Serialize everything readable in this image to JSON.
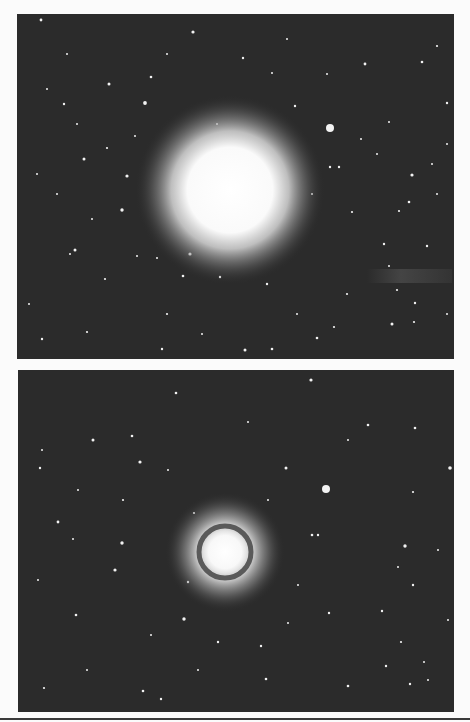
{
  "figure": {
    "background_color": "#fbfbfb",
    "sky_color": "#2b2b2b",
    "panels": [
      {
        "id": "top",
        "galaxy": {
          "cx": 213,
          "cy": 176,
          "core_r": 46,
          "halo_r": 95,
          "ring": false
        },
        "companion": {
          "cx": 313,
          "cy": 114,
          "r": 4
        },
        "streak": {
          "x": 350,
          "y": 255,
          "w": 85,
          "h": 14
        }
      },
      {
        "id": "bottom",
        "galaxy": {
          "cx": 207,
          "cy": 182,
          "core_r": 22,
          "ring_r": 26,
          "halo_r": 60,
          "ring": true
        },
        "companion": {
          "cx": 308,
          "cy": 119,
          "r": 4
        }
      }
    ],
    "stars_top": [
      [
        24,
        6,
        1.4
      ],
      [
        176,
        18,
        1.6
      ],
      [
        226,
        44,
        1.2
      ],
      [
        255,
        59,
        1
      ],
      [
        134,
        63,
        1.3
      ],
      [
        92,
        70,
        1.5
      ],
      [
        30,
        75,
        1
      ],
      [
        47,
        90,
        1.2
      ],
      [
        128,
        89,
        1.9
      ],
      [
        310,
        60,
        1
      ],
      [
        348,
        50,
        1.4
      ],
      [
        405,
        48,
        1.3
      ],
      [
        420,
        32,
        1.1
      ],
      [
        430,
        89,
        1.2
      ],
      [
        372,
        108,
        1
      ],
      [
        278,
        92,
        1.2
      ],
      [
        118,
        122,
        1
      ],
      [
        67,
        145,
        1.5
      ],
      [
        90,
        134,
        1.1
      ],
      [
        110,
        162,
        1.6
      ],
      [
        313,
        153,
        1.2
      ],
      [
        322,
        153,
        1.2
      ],
      [
        395,
        161,
        1.6
      ],
      [
        392,
        188,
        1.3
      ],
      [
        382,
        197,
        1.1
      ],
      [
        105,
        196,
        1.7
      ],
      [
        58,
        236,
        1.5
      ],
      [
        173,
        240,
        1.6
      ],
      [
        120,
        242,
        1
      ],
      [
        140,
        244,
        1
      ],
      [
        166,
        262,
        1.3
      ],
      [
        203,
        263,
        1.2
      ],
      [
        250,
        270,
        1.2
      ],
      [
        367,
        230,
        1.2
      ],
      [
        372,
        252,
        1
      ],
      [
        380,
        276,
        1.1
      ],
      [
        398,
        289,
        1.2
      ],
      [
        397,
        308,
        1.1
      ],
      [
        375,
        310,
        1.5
      ],
      [
        228,
        336,
        1.5
      ],
      [
        255,
        335,
        1.3
      ],
      [
        145,
        335,
        1.2
      ],
      [
        53,
        240,
        1
      ],
      [
        25,
        325,
        1.2
      ],
      [
        70,
        318,
        1.1
      ],
      [
        300,
        324,
        1.3
      ],
      [
        317,
        313,
        1.1
      ],
      [
        410,
        232,
        1.2
      ],
      [
        344,
        125,
        1
      ],
      [
        252,
        170,
        1
      ],
      [
        20,
        160,
        1
      ],
      [
        40,
        180,
        1
      ],
      [
        150,
        300,
        1.1
      ],
      [
        185,
        320,
        1
      ],
      [
        280,
        300,
        1
      ],
      [
        330,
        280,
        1.1
      ],
      [
        420,
        180,
        1
      ],
      [
        430,
        130,
        1
      ],
      [
        415,
        150,
        1
      ],
      [
        60,
        110,
        1
      ],
      [
        75,
        205,
        1
      ],
      [
        88,
        265,
        1.1
      ],
      [
        12,
        290,
        1
      ],
      [
        200,
        110,
        1
      ],
      [
        295,
        180,
        1
      ],
      [
        335,
        198,
        1.1
      ],
      [
        360,
        140,
        1
      ],
      [
        270,
        25,
        1
      ],
      [
        150,
        40,
        1
      ],
      [
        50,
        40,
        1
      ],
      [
        430,
        300,
        1
      ]
    ],
    "stars_bottom": [
      [
        158,
        23,
        1.3
      ],
      [
        293,
        10,
        1.6
      ],
      [
        350,
        55,
        1.3
      ],
      [
        397,
        58,
        1.3
      ],
      [
        230,
        52,
        1
      ],
      [
        114,
        66,
        1.3
      ],
      [
        75,
        70,
        1.5
      ],
      [
        24,
        80,
        1
      ],
      [
        22,
        98,
        1.2
      ],
      [
        122,
        92,
        1.6
      ],
      [
        268,
        98,
        1.5
      ],
      [
        432,
        98,
        1.8
      ],
      [
        395,
        122,
        1.1
      ],
      [
        105,
        130,
        1.1
      ],
      [
        40,
        152,
        1.4
      ],
      [
        55,
        169,
        1
      ],
      [
        104,
        173,
        1.7
      ],
      [
        176,
        143,
        1.1
      ],
      [
        294,
        165,
        1.3
      ],
      [
        300,
        165,
        1.2
      ],
      [
        387,
        176,
        1.7
      ],
      [
        380,
        197,
        1
      ],
      [
        395,
        215,
        1.2
      ],
      [
        97,
        200,
        1.6
      ],
      [
        170,
        212,
        1.2
      ],
      [
        58,
        245,
        1.3
      ],
      [
        166,
        249,
        1.7
      ],
      [
        133,
        265,
        1
      ],
      [
        311,
        243,
        1.2
      ],
      [
        364,
        241,
        1.2
      ],
      [
        200,
        272,
        1.2
      ],
      [
        243,
        276,
        1.2
      ],
      [
        270,
        253,
        1
      ],
      [
        383,
        272,
        1.1
      ],
      [
        368,
        296,
        1.2
      ],
      [
        406,
        292,
        1
      ],
      [
        392,
        314,
        1.2
      ],
      [
        330,
        316,
        1.3
      ],
      [
        248,
        309,
        1.3
      ],
      [
        125,
        321,
        1.3
      ],
      [
        143,
        329,
        1.2
      ],
      [
        26,
        318,
        1.1
      ],
      [
        69,
        300,
        1
      ],
      [
        300,
        345,
        1.1
      ],
      [
        336,
        345,
        1.3
      ],
      [
        410,
        310,
        1
      ],
      [
        20,
        210,
        1
      ],
      [
        150,
        100,
        1
      ],
      [
        250,
        130,
        1
      ],
      [
        330,
        70,
        1
      ],
      [
        420,
        180,
        1
      ],
      [
        60,
        120,
        1
      ],
      [
        430,
        250,
        1
      ],
      [
        280,
        215,
        1
      ],
      [
        180,
        300,
        1
      ]
    ],
    "rule_color": "#3a3a3a"
  }
}
